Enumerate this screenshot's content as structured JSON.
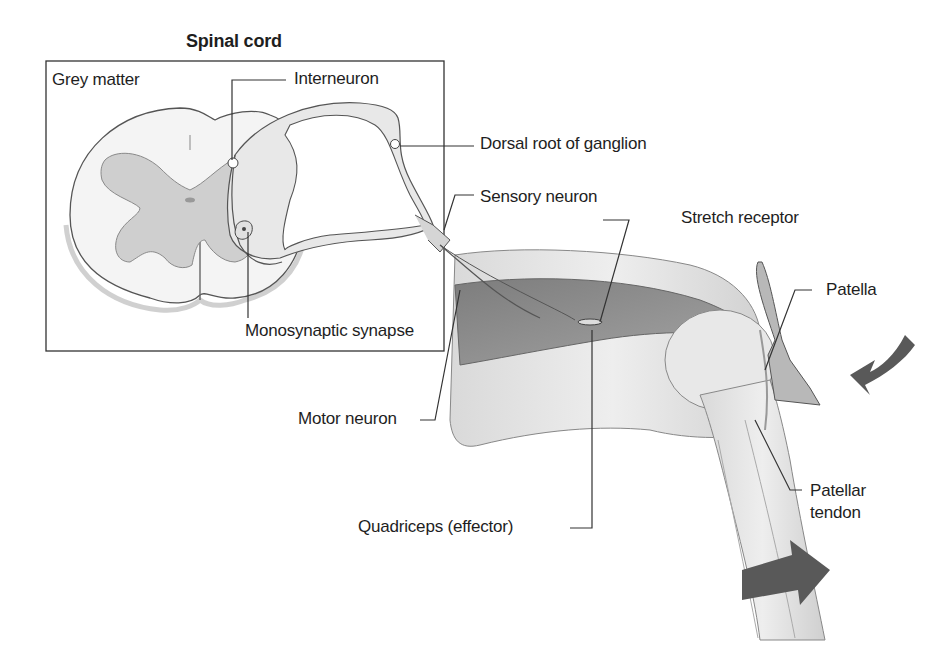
{
  "title": "Spinal cord",
  "labels": {
    "grey_matter": "Grey matter",
    "interneuron": "Interneuron",
    "dorsal_root": "Dorsal root of ganglion",
    "sensory_neuron": "Sensory neuron",
    "stretch_receptor": "Stretch receptor",
    "patella": "Patella",
    "monosynaptic_synapse": "Monosynaptic synapse",
    "motor_neuron": "Motor neuron",
    "quadriceps": "Quadriceps (effector)",
    "patellar_tendon_line1": "Patellar",
    "patellar_tendon_line2": "tendon"
  },
  "colors": {
    "line": "#333333",
    "tissue_light": "#e4e4e4",
    "tissue_mid": "#c8c8c8",
    "muscle": "#8a8a8a",
    "arrow": "#595959"
  }
}
